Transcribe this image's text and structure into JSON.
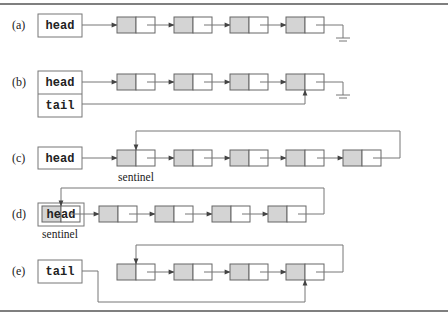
{
  "figure": {
    "panels": [
      {
        "id": "a",
        "label": "(a)",
        "pointers": [
          "head"
        ],
        "nodes": 4,
        "terminator": "ground",
        "caption": ""
      },
      {
        "id": "b",
        "label": "(b)",
        "pointers": [
          "head",
          "tail"
        ],
        "nodes": 4,
        "terminator": "ground",
        "caption": ""
      },
      {
        "id": "c",
        "label": "(c)",
        "pointers": [
          "head"
        ],
        "nodes": 5,
        "terminator": "loop-to-first",
        "caption": "sentinel"
      },
      {
        "id": "d",
        "label": "(d)",
        "pointers": [
          "head"
        ],
        "nodes": 4,
        "terminator": "loop-to-head",
        "caption": "sentinel"
      },
      {
        "id": "e",
        "label": "(e)",
        "pointers": [
          "tail"
        ],
        "nodes": 4,
        "terminator": "loop-to-first",
        "caption": ""
      }
    ]
  },
  "labels": {
    "a": "(a)",
    "b": "(b)",
    "c": "(c)",
    "d": "(d)",
    "e": "(e)"
  },
  "pointers": {
    "head": "head",
    "tail": "tail"
  },
  "captions": {
    "sentinel_c": "sentinel",
    "sentinel_d": "sentinel"
  },
  "colors": {
    "node_fill": "#d4d4d4",
    "stroke": "#666666",
    "background": "#ffffff"
  }
}
